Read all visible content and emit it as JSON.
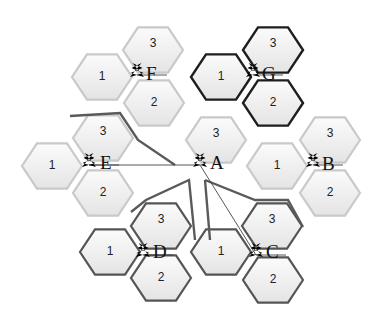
{
  "diagram": {
    "type": "cellular-network-hexagonal-sectors",
    "colors": {
      "cell_fill_light": "#fafafa",
      "cell_fill_dark": "#e6e6e6",
      "cell_stroke_light": "#c9c9c9",
      "cell_stroke_gray": "#555555",
      "cell_stroke_black": "#1e1e1e",
      "text": "#111111"
    },
    "base_stations": [
      {
        "id": "F",
        "label": "F",
        "sectors": [
          "1",
          "2",
          "3"
        ],
        "style": "light"
      },
      {
        "id": "G",
        "label": "G",
        "sectors": [
          "1",
          "2",
          "3"
        ],
        "style": "black"
      },
      {
        "id": "E",
        "label": "E",
        "sectors": [
          "1",
          "2",
          "3"
        ],
        "style": "light"
      },
      {
        "id": "A",
        "label": "A",
        "sectors": [
          "3"
        ],
        "style": "light"
      },
      {
        "id": "B",
        "label": "B",
        "sectors": [
          "1",
          "2",
          "3"
        ],
        "style": "light"
      },
      {
        "id": "D",
        "label": "D",
        "sectors": [
          "1",
          "2",
          "3"
        ],
        "style": "gray"
      },
      {
        "id": "C",
        "label": "C",
        "sectors": [
          "1",
          "2",
          "3"
        ],
        "style": "gray"
      }
    ],
    "links": [
      {
        "from": "E",
        "to": "A"
      },
      {
        "from": "A",
        "to": "C"
      }
    ]
  }
}
